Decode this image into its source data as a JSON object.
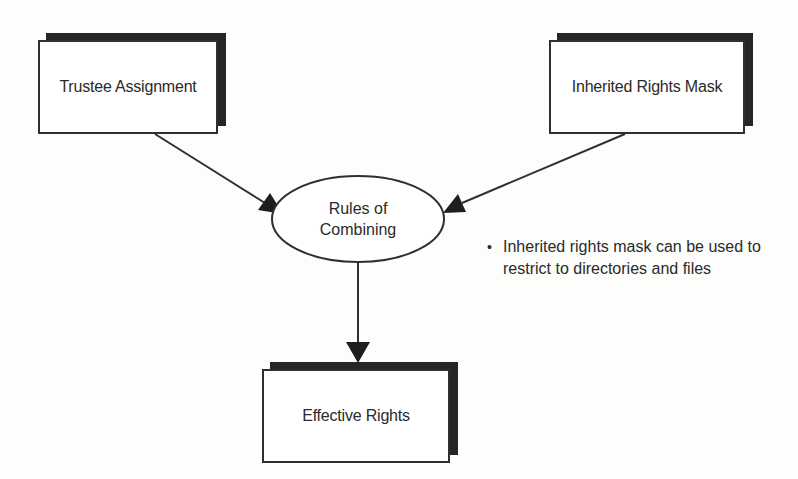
{
  "diagram": {
    "nodes": {
      "trustee": {
        "label": "Trustee Assignment",
        "shape": "shadowed-rectangle"
      },
      "irm": {
        "label": "Inherited Rights Mask",
        "shape": "shadowed-rectangle"
      },
      "rules": {
        "label_line1": "Rules of",
        "label_line2": "Combining",
        "shape": "ellipse"
      },
      "effective": {
        "label": "Effective Rights",
        "shape": "shadowed-rectangle"
      }
    },
    "edges": [
      {
        "from": "Trustee Assignment",
        "to": "Rules of Combining"
      },
      {
        "from": "Inherited Rights Mask",
        "to": "Rules of Combining"
      },
      {
        "from": "Rules of Combining",
        "to": "Effective Rights"
      }
    ],
    "note": {
      "bullet": "•",
      "text": "Inherited rights mask can be used to restrict to directories and files"
    },
    "colors": {
      "stroke": "#2f2f2f",
      "shadow": "#262626",
      "background": "#fdfdfb",
      "text": "#2a2a2a"
    }
  }
}
